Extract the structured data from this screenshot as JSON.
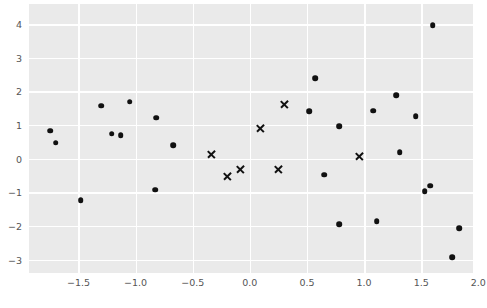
{
  "chart_data": {
    "type": "scatter",
    "title": "",
    "xlabel": "",
    "ylabel": "",
    "xlim": [
      -1.933,
      1.953
    ],
    "ylim": [
      -3.4,
      4.6
    ],
    "grid": true,
    "legend": "none",
    "background_color": "#eaeaea",
    "gridline_color": "#ffffff",
    "marker_color": "#111111",
    "xticks": [
      "-1.5",
      "-1.0",
      "-0.5",
      "0.0",
      "0.5",
      "1.0",
      "1.5",
      "2.0"
    ],
    "xtick_values": [
      -1.5,
      -1.0,
      -0.5,
      0.0,
      0.5,
      1.0,
      1.5,
      2.0
    ],
    "yticks": [
      "4",
      "3",
      "2",
      "1",
      "0",
      "-1",
      "-2",
      "-3"
    ],
    "ytick_values": [
      4,
      3,
      2,
      1,
      0,
      -1,
      -2,
      -3
    ],
    "series": [
      {
        "name": "circles",
        "marker": "circle",
        "points": [
          [
            -1.75,
            0.83
          ],
          [
            -1.7,
            0.47
          ],
          [
            -1.48,
            -1.24
          ],
          [
            -1.3,
            1.57
          ],
          [
            -1.21,
            0.74
          ],
          [
            -1.13,
            0.69
          ],
          [
            -1.05,
            1.69
          ],
          [
            -0.83,
            -0.92
          ],
          [
            -0.82,
            1.22
          ],
          [
            -0.67,
            0.4
          ],
          [
            0.52,
            1.41
          ],
          [
            0.57,
            2.4
          ],
          [
            0.65,
            -0.48
          ],
          [
            0.78,
            0.97
          ],
          [
            0.78,
            -1.95
          ],
          [
            1.08,
            1.43
          ],
          [
            1.11,
            -1.86
          ],
          [
            1.28,
            1.88
          ],
          [
            1.31,
            0.19
          ],
          [
            1.45,
            1.26
          ],
          [
            1.53,
            -0.96
          ],
          [
            1.58,
            -0.8
          ],
          [
            1.6,
            3.97
          ],
          [
            1.77,
            -2.93
          ],
          [
            1.83,
            -2.07
          ]
        ]
      },
      {
        "name": "crosses",
        "marker": "x",
        "points": [
          [
            -0.34,
            0.13
          ],
          [
            -0.2,
            -0.52
          ],
          [
            -0.08,
            -0.33
          ],
          [
            0.09,
            0.89
          ],
          [
            0.25,
            -0.31
          ],
          [
            0.3,
            1.63
          ],
          [
            0.96,
            0.07
          ]
        ]
      }
    ]
  }
}
